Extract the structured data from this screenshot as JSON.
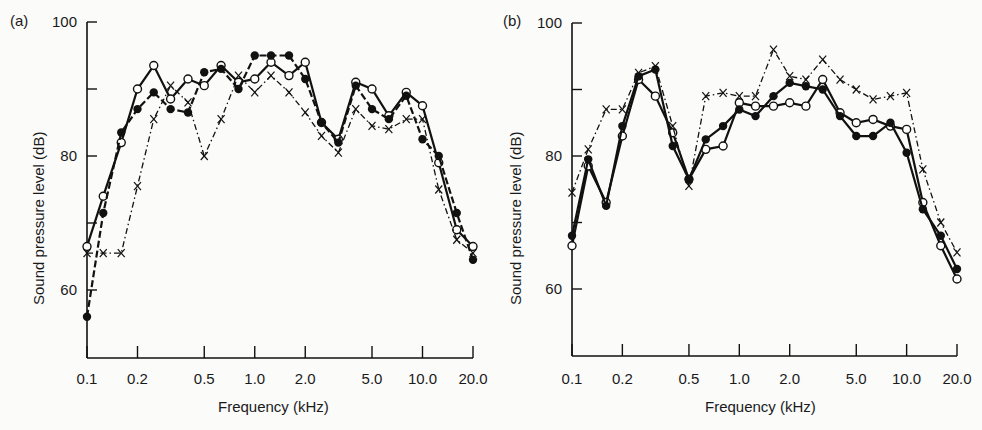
{
  "chart_data": [
    {
      "panel": "(a)",
      "type": "line",
      "title": "",
      "xlabel": "Frequency (kHz)",
      "ylabel": "Sound pressure level (dB)",
      "xscale": "log",
      "xlim": [
        0.1,
        20.0
      ],
      "ylim": [
        50,
        100
      ],
      "xticks": [
        "0.1",
        "0.2",
        "0.5",
        "1.0",
        "2.0",
        "5.0",
        "10.0",
        "20.0"
      ],
      "yticks": [
        "60",
        "80",
        "100"
      ],
      "grid": false,
      "legend": "none",
      "x": [
        0.1,
        0.125,
        0.16,
        0.2,
        0.25,
        0.315,
        0.4,
        0.5,
        0.63,
        0.8,
        1.0,
        1.25,
        1.6,
        2.0,
        2.5,
        3.15,
        4.0,
        5.0,
        6.3,
        8.0,
        10.0,
        12.5,
        16.0,
        20.0
      ],
      "series": [
        {
          "name": "open-circles",
          "marker": "open-circle",
          "line": "solid",
          "values": [
            66.5,
            74,
            82,
            90,
            93.5,
            88.5,
            91.5,
            90.5,
            93.5,
            91,
            91.5,
            94,
            92,
            94,
            85,
            82.5,
            91,
            90,
            86,
            89.5,
            87.5,
            79,
            69,
            66.5
          ]
        },
        {
          "name": "filled-circles",
          "marker": "filled-circle",
          "line": "dashed",
          "values": [
            56,
            71.5,
            83.5,
            87,
            89.5,
            87,
            86.5,
            92.5,
            93,
            90,
            95,
            95,
            95,
            91.5,
            85,
            82,
            90.5,
            87,
            85.5,
            89,
            82.5,
            80,
            71.5,
            64.5
          ]
        },
        {
          "name": "crosses",
          "marker": "x",
          "line": "dash-dot",
          "values": [
            65.5,
            65.5,
            65.5,
            75.5,
            85.5,
            90.5,
            88,
            80,
            85.5,
            92,
            89.5,
            92,
            89.5,
            86.5,
            83,
            80.5,
            87,
            84.5,
            84,
            85.5,
            85.5,
            75,
            67.5,
            65.5
          ]
        }
      ]
    },
    {
      "panel": "(b)",
      "type": "line",
      "title": "",
      "xlabel": "Frequency (kHz)",
      "ylabel": "Sound pressure level (dB)",
      "xscale": "log",
      "xlim": [
        0.1,
        20.0
      ],
      "ylim": [
        50,
        100
      ],
      "xticks": [
        "0.1",
        "0.2",
        "0.5",
        "1.0",
        "2.0",
        "5.0",
        "10.0",
        "20.0"
      ],
      "yticks": [
        "60",
        "80",
        "100"
      ],
      "grid": false,
      "legend": "none",
      "x": [
        0.1,
        0.125,
        0.16,
        0.2,
        0.25,
        0.315,
        0.4,
        0.5,
        0.63,
        0.8,
        1.0,
        1.25,
        1.6,
        2.0,
        2.5,
        3.15,
        4.0,
        5.0,
        6.3,
        8.0,
        10.0,
        12.5,
        16.0,
        20.0
      ],
      "series": [
        {
          "name": "open-circles",
          "marker": "open-circle",
          "line": "solid",
          "values": [
            66.5,
            78.5,
            73,
            83,
            91.5,
            89,
            83.5,
            76.5,
            81,
            81.5,
            88,
            87.5,
            87.5,
            88,
            87.5,
            91.5,
            86.5,
            85,
            85.5,
            84.5,
            84,
            73,
            66.5,
            61.5
          ]
        },
        {
          "name": "filled-circles",
          "marker": "filled-circle",
          "line": "solid",
          "values": [
            68,
            79.5,
            72.5,
            84.5,
            92,
            93,
            81.5,
            76.5,
            82.5,
            84.5,
            87,
            86,
            89,
            91,
            90.5,
            90,
            86,
            83,
            83,
            85,
            80.5,
            72,
            68,
            63
          ]
        },
        {
          "name": "crosses",
          "marker": "x",
          "line": "dash-dot",
          "values": [
            74.5,
            81,
            87,
            87,
            92.5,
            93.5,
            84.5,
            75.5,
            89,
            89.5,
            89,
            89,
            96,
            92,
            91.5,
            94.5,
            91.5,
            90,
            88.5,
            89,
            89.5,
            78,
            70,
            65.5
          ]
        }
      ]
    }
  ],
  "panels": {
    "a": {
      "label": "(a)",
      "xlabel": "Frequency (kHz)",
      "ylabel": "Sound pressure level (dB)"
    },
    "b": {
      "label": "(b)",
      "xlabel": "Frequency (kHz)",
      "ylabel": "Sound pressure level (dB)"
    }
  }
}
